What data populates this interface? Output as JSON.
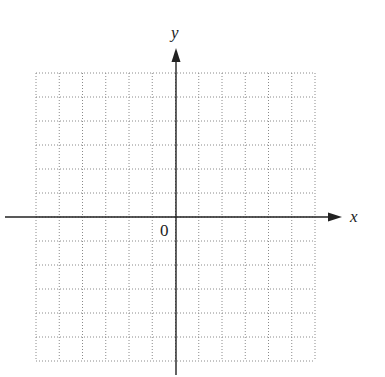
{
  "diagram": {
    "type": "coordinate-grid",
    "axes": {
      "x_label": "x",
      "y_label": "y",
      "origin_label": "0"
    },
    "grid": {
      "columns": 12,
      "rows": 12,
      "columns_left_of_origin": 6,
      "columns_right_of_origin": 6,
      "rows_above_origin": 6,
      "rows_below_origin": 6,
      "line_style": "dotted"
    },
    "colors": {
      "axis": "#222222",
      "grid": "#8a8a8a",
      "background": "#ffffff"
    }
  }
}
